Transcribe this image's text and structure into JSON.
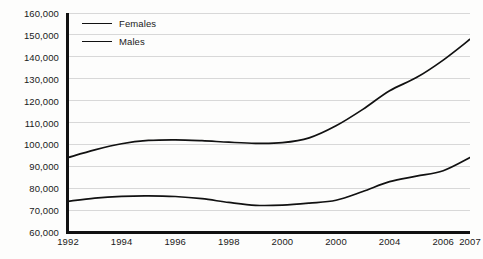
{
  "chart_data": {
    "type": "line",
    "title": "",
    "subtitle": "",
    "xlabel": "",
    "ylabel": "",
    "ylim": [
      60000,
      160000
    ],
    "ytick_step": 10000,
    "ytick_labels": [
      "160,000",
      "150,000",
      "140,000",
      "130,000",
      "120,000",
      "110,000",
      "100,000",
      "90,000",
      "80,000",
      "70,000",
      "60,000"
    ],
    "ytick_values": [
      160000,
      150000,
      140000,
      130000,
      120000,
      110000,
      100000,
      90000,
      80000,
      70000,
      60000
    ],
    "xtick_labels": [
      "1992",
      "1994",
      "1996",
      "1998",
      "2000",
      "2000",
      "2004",
      "2006",
      "2007"
    ],
    "xtick_values": [
      1992,
      1994,
      1996,
      1998,
      2000,
      2002,
      2004,
      2006,
      2007
    ],
    "grid": "horizontal",
    "legend_position": "top-left-inside",
    "line_color": "#111111",
    "grid_color": "#d8d8d8",
    "axis_color": "#111111",
    "background_color": "#fdfdfc",
    "x": [
      1992,
      1993,
      1994,
      1995,
      1996,
      1997,
      1998,
      1999,
      2000,
      2001,
      2002,
      2003,
      2004,
      2005,
      2006,
      2007
    ],
    "series": [
      {
        "name": "Females",
        "values": [
          94000,
          97500,
          100300,
          101800,
          102100,
          101700,
          101000,
          100500,
          100800,
          103000,
          108500,
          116000,
          124500,
          130500,
          138500,
          148000
        ]
      },
      {
        "name": "Males",
        "values": [
          74000,
          75500,
          76300,
          76500,
          76200,
          75200,
          73500,
          72200,
          72300,
          73200,
          74500,
          78500,
          83000,
          85500,
          88000,
          94000
        ]
      }
    ]
  },
  "legend": {
    "items": [
      {
        "label": "Females",
        "swatch": "line-swatch-icon"
      },
      {
        "label": "Males",
        "swatch": "line-swatch-icon"
      }
    ]
  }
}
